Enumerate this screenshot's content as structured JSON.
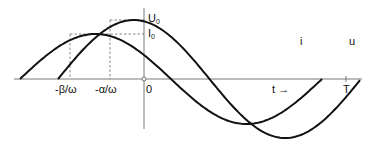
{
  "diagram": {
    "title": "",
    "curves": [
      {
        "id": "i",
        "label": "i",
        "amplitude_label": "I",
        "amplitude_sub": "0",
        "phase_label": "-β/ω"
      },
      {
        "id": "u",
        "label": "u",
        "amplitude_label": "U",
        "amplitude_sub": "0",
        "phase_label": "-α/ω"
      }
    ],
    "axis": {
      "origin_label": "0",
      "time_label": "t",
      "time_arrow": "→",
      "period_label": "T"
    },
    "colors": {
      "line": "#111111",
      "axis": "#555555",
      "dashed": "#555555"
    }
  }
}
